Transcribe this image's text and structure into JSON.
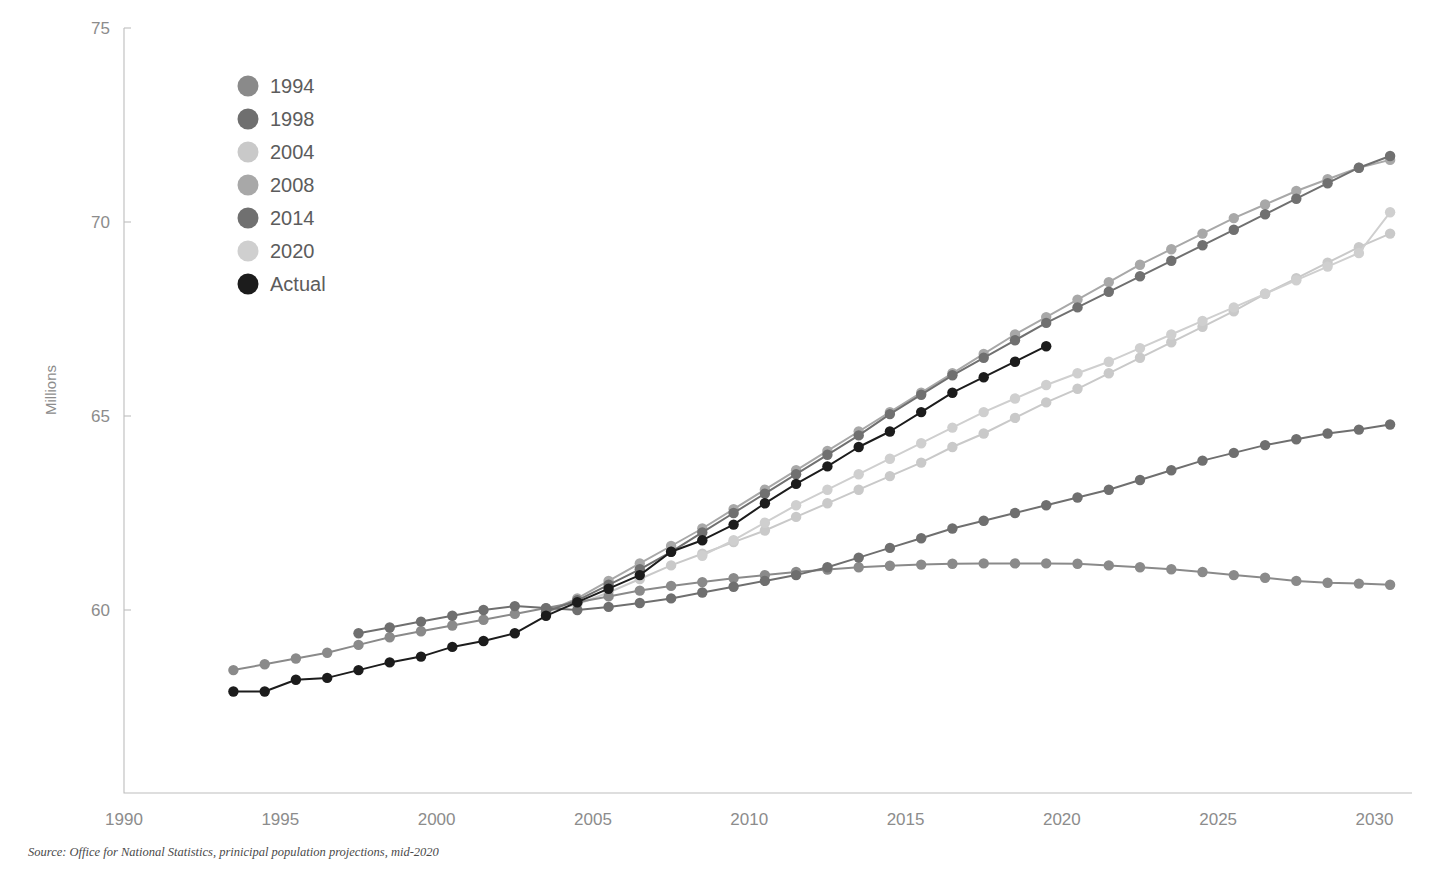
{
  "title": "",
  "source_note": "Source: Office for National Statistics, prinicipal population projections, mid-2020",
  "axis": {
    "ylabel": "Millions",
    "ytick_labels": [
      "75",
      "70",
      "65",
      "60"
    ],
    "xtick_labels": [
      "1990",
      "1995",
      "2000",
      "2005",
      "2010",
      "2015",
      "2020",
      "2025",
      "2030"
    ]
  },
  "legend": {
    "items": [
      {
        "label": "1994",
        "color": "#8a8a8a"
      },
      {
        "label": "1998",
        "color": "#6f6f6f"
      },
      {
        "label": "2004",
        "color": "#c9c9c9"
      },
      {
        "label": "2008",
        "color": "#a8a8a8"
      },
      {
        "label": "2014",
        "color": "#707070"
      },
      {
        "label": "2020",
        "color": "#cfcfcf"
      },
      {
        "label": "Actual",
        "color": "#1c1c1c"
      }
    ]
  },
  "chart_data": {
    "type": "line",
    "title": "",
    "xlabel": "",
    "ylabel": "Millions",
    "xlim": [
      1990,
      2031
    ],
    "ylim": [
      55.3,
      75
    ],
    "grid": false,
    "legend_position": "top-left",
    "units": "Millions",
    "series": [
      {
        "name": "1994",
        "color": "#8a8a8a",
        "x": [
          1993.5,
          1994.5,
          1995.5,
          1996.5,
          1997.5,
          1998.5,
          1999.5,
          2000.5,
          2001.5,
          2002.5,
          2003.5,
          2004.5,
          2005.5,
          2006.5,
          2007.5,
          2008.5,
          2009.5,
          2010.5,
          2011.5,
          2012.5,
          2013.5,
          2014.5,
          2015.5,
          2016.5,
          2017.5,
          2018.5,
          2019.5,
          2020.5,
          2021.5,
          2022.5,
          2023.5,
          2024.5,
          2025.5,
          2026.5,
          2027.5,
          2028.5,
          2029.5,
          2030.5
        ],
        "y": [
          58.45,
          58.6,
          58.75,
          58.9,
          59.1,
          59.3,
          59.45,
          59.6,
          59.75,
          59.9,
          60.05,
          60.2,
          60.35,
          60.5,
          60.62,
          60.72,
          60.82,
          60.9,
          60.98,
          61.04,
          61.1,
          61.14,
          61.17,
          61.19,
          61.2,
          61.2,
          61.2,
          61.19,
          61.15,
          61.1,
          61.05,
          60.98,
          60.9,
          60.83,
          60.75,
          60.7,
          60.68,
          60.65
        ]
      },
      {
        "name": "1998",
        "color": "#6f6f6f",
        "x": [
          1997.5,
          1998.5,
          1999.5,
          2000.5,
          2001.5,
          2002.5,
          2003.5,
          2004.5,
          2005.5,
          2006.5,
          2007.5,
          2008.5,
          2009.5,
          2010.5,
          2011.5,
          2012.5,
          2013.5,
          2014.5,
          2015.5,
          2016.5,
          2017.5,
          2018.5,
          2019.5,
          2020.5,
          2021.5,
          2022.5,
          2023.5,
          2024.5,
          2025.5,
          2026.5,
          2027.5,
          2028.5,
          2029.5,
          2030.5
        ],
        "y": [
          59.4,
          59.55,
          59.7,
          59.85,
          60.0,
          60.1,
          60.05,
          60.0,
          60.08,
          60.18,
          60.3,
          60.45,
          60.6,
          60.75,
          60.9,
          61.1,
          61.35,
          61.6,
          61.85,
          62.1,
          62.3,
          62.5,
          62.7,
          62.9,
          63.1,
          63.35,
          63.6,
          63.85,
          64.05,
          64.25,
          64.4,
          64.55,
          64.65,
          64.78
        ]
      },
      {
        "name": "2004",
        "color": "#c9c9c9",
        "x": [
          2003.5,
          2004.5,
          2005.5,
          2006.5,
          2007.5,
          2008.5,
          2009.5,
          2010.5,
          2011.5,
          2012.5,
          2013.5,
          2014.5,
          2015.5,
          2016.5,
          2017.5,
          2018.5,
          2019.5,
          2020.5,
          2021.5,
          2022.5,
          2023.5,
          2024.5,
          2025.5,
          2026.5,
          2027.5,
          2028.5,
          2029.5,
          2030.5
        ],
        "y": [
          59.95,
          60.15,
          60.45,
          60.8,
          61.15,
          61.45,
          61.75,
          62.05,
          62.4,
          62.75,
          63.1,
          63.45,
          63.8,
          64.2,
          64.55,
          64.95,
          65.35,
          65.7,
          66.1,
          66.5,
          66.9,
          67.3,
          67.7,
          68.15,
          68.55,
          68.95,
          69.35,
          69.7
        ]
      },
      {
        "name": "2008",
        "color": "#a8a8a8",
        "x": [
          2003.5,
          2004.5,
          2005.5,
          2006.5,
          2007.5,
          2008.5,
          2009.5,
          2010.5,
          2011.5,
          2012.5,
          2013.5,
          2014.5,
          2015.5,
          2016.5,
          2017.5,
          2018.5,
          2019.5,
          2020.5,
          2021.5,
          2022.5,
          2023.5,
          2024.5,
          2025.5,
          2026.5,
          2027.5,
          2028.5,
          2029.5,
          2030.5
        ],
        "y": [
          59.95,
          60.3,
          60.75,
          61.2,
          61.65,
          62.1,
          62.6,
          63.1,
          63.6,
          64.1,
          64.6,
          65.1,
          65.6,
          66.1,
          66.6,
          67.1,
          67.55,
          68.0,
          68.45,
          68.9,
          69.3,
          69.7,
          70.1,
          70.45,
          70.8,
          71.1,
          71.4,
          71.6
        ]
      },
      {
        "name": "2014",
        "color": "#707070",
        "x": [
          2003.5,
          2004.5,
          2005.5,
          2006.5,
          2007.5,
          2008.5,
          2009.5,
          2010.5,
          2011.5,
          2012.5,
          2013.5,
          2014.5,
          2015.5,
          2016.5,
          2017.5,
          2018.5,
          2019.5,
          2020.5,
          2021.5,
          2022.5,
          2023.5,
          2024.5,
          2025.5,
          2026.5,
          2027.5,
          2028.5,
          2029.5,
          2030.5
        ],
        "y": [
          59.95,
          60.25,
          60.65,
          61.05,
          61.5,
          62.0,
          62.5,
          63.0,
          63.5,
          64.0,
          64.5,
          65.05,
          65.55,
          66.05,
          66.5,
          66.95,
          67.4,
          67.8,
          68.2,
          68.6,
          69.0,
          69.4,
          69.8,
          70.2,
          70.6,
          71.0,
          71.4,
          71.7
        ]
      },
      {
        "name": "2020",
        "color": "#cfcfcf",
        "x": [
          2008.5,
          2009.5,
          2010.5,
          2011.5,
          2012.5,
          2013.5,
          2014.5,
          2015.5,
          2016.5,
          2017.5,
          2018.5,
          2019.5,
          2020.5,
          2021.5,
          2022.5,
          2023.5,
          2024.5,
          2025.5,
          2026.5,
          2027.5,
          2028.5,
          2029.5,
          2030.5
        ],
        "y": [
          61.4,
          61.8,
          62.25,
          62.7,
          63.1,
          63.5,
          63.9,
          64.3,
          64.7,
          65.1,
          65.45,
          65.8,
          66.1,
          66.4,
          66.75,
          67.1,
          67.45,
          67.8,
          68.15,
          68.5,
          68.85,
          69.2,
          70.25
        ]
      },
      {
        "name": "Actual",
        "color": "#1c1c1c",
        "x": [
          1993.5,
          1994.5,
          1995.5,
          1996.5,
          1997.5,
          1998.5,
          1999.5,
          2000.5,
          2001.5,
          2002.5,
          2003.5,
          2004.5,
          2005.5,
          2006.5,
          2007.5,
          2008.5,
          2009.5,
          2010.5,
          2011.5,
          2012.5,
          2013.5,
          2014.5,
          2015.5,
          2016.5,
          2017.5,
          2018.5,
          2019.5
        ],
        "y": [
          57.9,
          57.9,
          58.2,
          58.25,
          58.45,
          58.65,
          58.8,
          59.05,
          59.2,
          59.4,
          59.85,
          60.2,
          60.55,
          60.9,
          61.5,
          61.8,
          62.2,
          62.75,
          63.25,
          63.7,
          64.2,
          64.6,
          65.1,
          65.6,
          66.0,
          66.4,
          66.8
        ]
      }
    ]
  }
}
